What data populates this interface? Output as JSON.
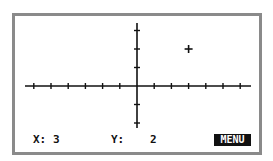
{
  "graph": {
    "x_axis_ticks": [
      -6,
      -5,
      -4,
      -3,
      -2,
      -1,
      1,
      2,
      3,
      4,
      5,
      6
    ],
    "y_axis_ticks": [
      -2,
      -1,
      1,
      2,
      3
    ],
    "cursor": {
      "x": 3,
      "y": 2
    },
    "colors": {
      "frame": "#8a8a8a",
      "axes": "#111111",
      "background": "#ffffff"
    }
  },
  "status_bar": {
    "x_label": "X:",
    "x_value": "3",
    "y_label": "Y:",
    "y_value": "2",
    "menu_label": "MENU"
  }
}
